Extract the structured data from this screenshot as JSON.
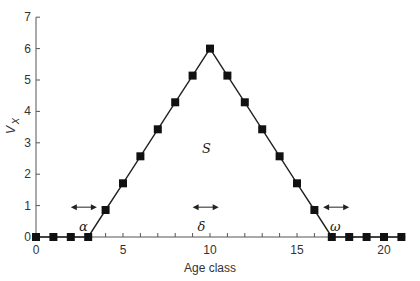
{
  "chart_data": {
    "type": "line",
    "title": "",
    "xlabel": "Age class",
    "ylabel": "Vx",
    "ylabel_main": "V",
    "ylabel_sub": "x",
    "xlim": [
      0,
      21
    ],
    "ylim": [
      0,
      7
    ],
    "x_ticks": [
      0,
      5,
      10,
      15,
      20
    ],
    "y_ticks": [
      0,
      1,
      2,
      3,
      4,
      5,
      6,
      7
    ],
    "grid": false,
    "legend": null,
    "marker": "square",
    "series": [
      {
        "name": "Vx",
        "x": [
          0,
          1,
          2,
          3,
          4,
          5,
          6,
          7,
          8,
          9,
          10,
          11,
          12,
          13,
          14,
          15,
          16,
          17,
          18,
          19,
          20,
          21
        ],
        "values": [
          0,
          0,
          0,
          0,
          0.86,
          1.71,
          2.57,
          3.43,
          4.29,
          5.14,
          6,
          5.14,
          4.29,
          3.43,
          2.57,
          1.71,
          0.86,
          0,
          0,
          0,
          0,
          0
        ]
      }
    ],
    "annotations": [
      {
        "text": "α",
        "x": 2.5,
        "y": 0.35,
        "arrow": "double-horizontal",
        "arrow_x": [
          2,
          3.5
        ],
        "arrow_y": 0.95
      },
      {
        "text": "δ",
        "x": 9.5,
        "y": 0.35,
        "arrow": "double-horizontal",
        "arrow_x": [
          9,
          10.5
        ],
        "arrow_y": 0.95
      },
      {
        "text": "ω",
        "x": 17.2,
        "y": 0.35,
        "arrow": "double-horizontal",
        "arrow_x": [
          16.5,
          18
        ],
        "arrow_y": 0.95
      },
      {
        "text": "S",
        "x": 9.8,
        "y": 2.85
      }
    ]
  },
  "labels": {
    "x_title": "Age class",
    "y_title_main": "V",
    "y_title_sub": "x",
    "alpha": "α",
    "delta": "δ",
    "omega": "ω",
    "s_label": "S"
  }
}
